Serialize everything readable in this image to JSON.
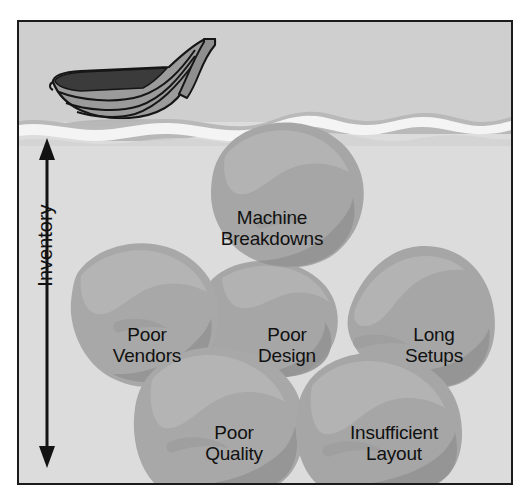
{
  "diagram": {
    "axis": {
      "label": "Inventory",
      "orientation": "vertical",
      "arrow": "double-headed"
    },
    "scene": {
      "boat_label": "boat",
      "waterline_label": "water-surface",
      "sky_color": "#d0d0d0",
      "water_color": "#dcdcdc",
      "foam_color": "#f2f2f2",
      "wave_color": "#b2b2b2",
      "rock_fill": "#a7a7a7",
      "rock_shade": "#949494",
      "rock_highlight": "#b6b6b6",
      "frame_color": "#1b1b1b",
      "text_color": "#111111",
      "boat_hull_color": "#9a9a9a",
      "boat_interior_color": "#3a3a3a",
      "boat_outline_color": "#1b1b1b"
    },
    "rocks": [
      {
        "id": "machine-breakdowns",
        "lines": [
          "Machine",
          "Breakdowns"
        ],
        "x": 253,
        "y": 203,
        "font_size": 19
      },
      {
        "id": "poor-vendors",
        "lines": [
          "Poor",
          "Vendors"
        ],
        "x": 128,
        "y": 320,
        "font_size": 19
      },
      {
        "id": "poor-design",
        "lines": [
          "Poor",
          "Design"
        ],
        "x": 268,
        "y": 320,
        "font_size": 19
      },
      {
        "id": "long-setups",
        "lines": [
          "Long",
          "Setups"
        ],
        "x": 415,
        "y": 320,
        "font_size": 19
      },
      {
        "id": "poor-quality",
        "lines": [
          "Poor",
          "Quality"
        ],
        "x": 215,
        "y": 420,
        "font_size": 19
      },
      {
        "id": "insufficient-layout",
        "lines": [
          "Insufficient",
          "Layout"
        ],
        "x": 375,
        "y": 420,
        "font_size": 19
      }
    ]
  }
}
